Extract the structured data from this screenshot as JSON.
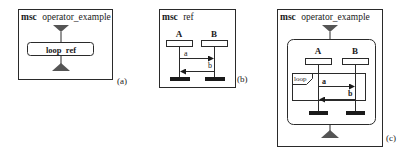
{
  "panels": {
    "a": {
      "keyword": "msc",
      "name": "operator_example",
      "ref_text": "loop  ref",
      "caption": "(a)"
    },
    "b": {
      "keyword": "msc",
      "name": "ref",
      "instances": [
        "A",
        "B"
      ],
      "messages": [
        "a",
        "b"
      ],
      "caption": "(b)"
    },
    "c": {
      "keyword": "msc",
      "name": "operator_example",
      "instances": [
        "A",
        "B"
      ],
      "operator": "loop",
      "messages": [
        "a",
        "b"
      ],
      "caption": "(c)"
    }
  },
  "colors": {
    "stroke": "#2a2a2a",
    "triangle": "#555555",
    "instance_end": "#1a1a1a"
  }
}
